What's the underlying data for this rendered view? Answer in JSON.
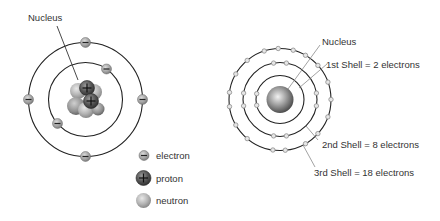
{
  "left_diagram": {
    "title_label": "Nucleus",
    "center": [
      85.5,
      99.5
    ],
    "outer_shell_radius": 57,
    "inner_shell_radius": 37,
    "inner_shell_electrons_deg": [
      -60,
      150
    ],
    "outer_shell_electrons_deg": [
      -90,
      0,
      90,
      180
    ],
    "legend": [
      {
        "label": "electron",
        "symbol": "minus",
        "color": "#9a9a9a"
      },
      {
        "label": "proton",
        "symbol": "plus",
        "color": "#555555"
      },
      {
        "label": "neutron",
        "symbol": "none",
        "color": "#bdbdbd"
      }
    ]
  },
  "right_diagram": {
    "center": [
      280,
      99.5
    ],
    "nucleus_label": "Nucleus",
    "shells": [
      {
        "label": "1st Shell = 2 electrons",
        "radius": 24,
        "electrons": 2
      },
      {
        "label": "2nd Shell = 8 electrons",
        "radius": 37,
        "electrons": 8
      },
      {
        "label": "3rd Shell = 18 electrons",
        "radius": 51,
        "electrons": 18
      }
    ]
  },
  "colors": {
    "ring": "#222222",
    "leader": "#8a8a8a",
    "text": "#333333",
    "electron_fill": "#a8a8a8",
    "proton_fill": "#5a5a5a",
    "neutron_fill": "#c4c4c4",
    "small_electron_fill": "#e6e6e6",
    "small_electron_stroke": "#8c8c8c"
  }
}
